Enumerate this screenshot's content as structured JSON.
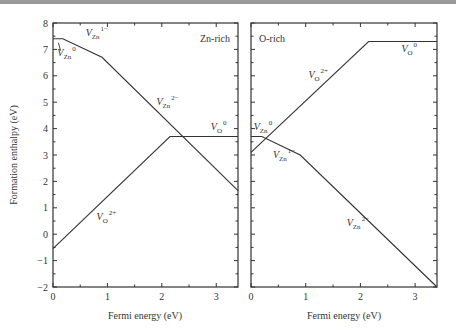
{
  "chart_data": [
    {
      "type": "line",
      "panel_label": "Zn-rich",
      "xlabel": "Fermi energy (eV)",
      "ylabel": "Formation enthalpy (eV)",
      "xlim": [
        0,
        3.4
      ],
      "ylim": [
        -2,
        8
      ],
      "x_ticks": [
        0,
        1,
        2,
        3
      ],
      "y_ticks": [
        -2,
        -1,
        0,
        1,
        2,
        3,
        4,
        5,
        6,
        7,
        8
      ],
      "grid": false,
      "series": [
        {
          "name": "V_Zn",
          "x": [
            0,
            0.18,
            0.9,
            3.4
          ],
          "y": [
            7.4,
            7.4,
            6.7,
            1.65
          ]
        },
        {
          "name": "V_O",
          "x": [
            0,
            2.15,
            3.4
          ],
          "y": [
            -0.55,
            3.7,
            3.7
          ]
        }
      ],
      "annotations": [
        {
          "text": "V_Zn^0",
          "x": 0.08,
          "y": 6.75
        },
        {
          "text": "V_Zn^1-",
          "x": 0.6,
          "y": 7.5
        },
        {
          "text": "V_Zn^2-",
          "x": 1.9,
          "y": 4.9
        },
        {
          "text": "V_O^0",
          "x": 2.9,
          "y": 3.95
        },
        {
          "text": "V_O^2+",
          "x": 0.8,
          "y": 0.55
        }
      ]
    },
    {
      "type": "line",
      "panel_label": "O-rich",
      "xlabel": "Fermi energy (eV)",
      "ylabel": "",
      "xlim": [
        0,
        3.4
      ],
      "ylim": [
        -2,
        8
      ],
      "x_ticks": [
        0,
        1,
        2,
        3
      ],
      "y_ticks": [
        -2,
        -1,
        0,
        1,
        2,
        3,
        4,
        5,
        6,
        7,
        8
      ],
      "grid": false,
      "series": [
        {
          "name": "V_Zn",
          "x": [
            0,
            0.2,
            0.9,
            3.4
          ],
          "y": [
            3.7,
            3.7,
            3.0,
            -2.0
          ]
        },
        {
          "name": "V_O",
          "x": [
            0,
            2.15,
            3.4
          ],
          "y": [
            3.1,
            7.3,
            7.3
          ]
        }
      ],
      "annotations": [
        {
          "text": "V_Zn^0",
          "x": 0.05,
          "y": 3.95
        },
        {
          "text": "V_Zn^1-",
          "x": 0.4,
          "y": 2.9
        },
        {
          "text": "V_Zn^2-",
          "x": 1.75,
          "y": 0.3
        },
        {
          "text": "V_O^2+",
          "x": 1.05,
          "y": 5.9
        },
        {
          "text": "V_O^0",
          "x": 2.75,
          "y": 6.9
        }
      ]
    }
  ],
  "labels": {
    "ylabel": "Formation enthalpy (eV)",
    "xlabel_left": "Fermi energy (eV)",
    "xlabel_right": "Fermi energy (eV)",
    "panel_left": "Zn-rich",
    "panel_right": "O-rich",
    "V": "V",
    "Zn": "Zn",
    "O": "O",
    "sup0": "0",
    "sup1m": "1−",
    "sup2m": "2−",
    "sup2p": "2+"
  }
}
